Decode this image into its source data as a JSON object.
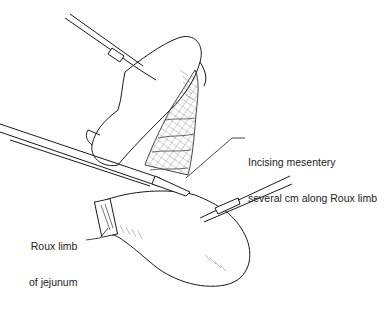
{
  "figure": {
    "type": "surgical illustration"
  },
  "labels": {
    "mesentery_line1": "Incising mesentery",
    "mesentery_line2": "several cm along Roux limb",
    "roux_line1": "Roux limb",
    "roux_line2": "of jejunum"
  },
  "colors": {
    "ink": "#1a1a1a",
    "background": "#ffffff"
  }
}
